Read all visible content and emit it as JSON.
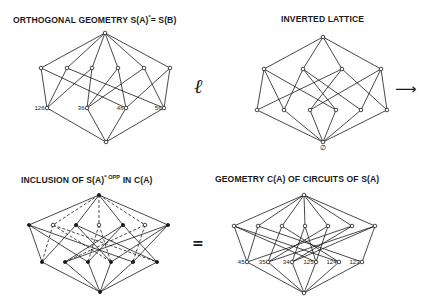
{
  "titles": {
    "top_left": "ORTHOGONAL GEOMETRY S(A)",
    "top_left_sup": "*",
    "top_left_tail": "= S(B)",
    "top_right": "INVERTED LATTICE",
    "bottom_left": "INCLUSION OF S(A)",
    "bottom_left_sup": "* OPP",
    "bottom_left_tail": " IN C(A)",
    "bottom_right": "GEOMETRY C(A) OF CIRCUITS OF S(A)"
  },
  "symbols": {
    "ell": "ℓ",
    "arrow": "⟶",
    "equals": "=",
    "empty_set": "∅"
  },
  "colors": {
    "ink": "#1a1a1a",
    "paper": "#ffffff"
  },
  "lattices": [
    {
      "id": "orthogonal-geometry",
      "nodes": [
        {
          "id": "T",
          "x": 105,
          "y": 33,
          "style": "hollow"
        },
        {
          "id": "M0",
          "x": 41,
          "y": 68,
          "style": "hollow"
        },
        {
          "id": "M1",
          "x": 67,
          "y": 68,
          "style": "hollow"
        },
        {
          "id": "M2",
          "x": 92,
          "y": 68,
          "style": "hollow"
        },
        {
          "id": "M3",
          "x": 118,
          "y": 68,
          "style": "hollow"
        },
        {
          "id": "M4",
          "x": 144,
          "y": 68,
          "style": "hollow"
        },
        {
          "id": "M5",
          "x": 170,
          "y": 68,
          "style": "hollow"
        },
        {
          "id": "B0",
          "x": 47,
          "y": 108,
          "style": "hollow",
          "label": "126"
        },
        {
          "id": "B1",
          "x": 87,
          "y": 108,
          "style": "hollow",
          "label": "36"
        },
        {
          "id": "B2",
          "x": 126,
          "y": 108,
          "style": "hollow",
          "label": "46"
        },
        {
          "id": "B3",
          "x": 164,
          "y": 108,
          "style": "hollow",
          "label": "56"
        },
        {
          "id": "Z",
          "x": 106,
          "y": 142,
          "style": "hollow"
        }
      ],
      "edges": [
        [
          "T",
          "M0"
        ],
        [
          "T",
          "M1"
        ],
        [
          "T",
          "M2"
        ],
        [
          "T",
          "M3"
        ],
        [
          "T",
          "M4"
        ],
        [
          "T",
          "M5"
        ],
        [
          "M0",
          "B0"
        ],
        [
          "M0",
          "B2"
        ],
        [
          "M1",
          "B0"
        ],
        [
          "M1",
          "B3"
        ],
        [
          "M2",
          "B0"
        ],
        [
          "M2",
          "B1"
        ],
        [
          "M3",
          "B1"
        ],
        [
          "M3",
          "B2"
        ],
        [
          "M4",
          "B1"
        ],
        [
          "M4",
          "B3"
        ],
        [
          "M5",
          "B2"
        ],
        [
          "M5",
          "B3"
        ],
        [
          "B0",
          "Z"
        ],
        [
          "B1",
          "Z"
        ],
        [
          "B2",
          "Z"
        ],
        [
          "B3",
          "Z"
        ]
      ],
      "dashed_edges": []
    },
    {
      "id": "inverted-lattice",
      "nodes": [
        {
          "id": "T",
          "x": 323,
          "y": 37,
          "style": "hollow"
        },
        {
          "id": "M0",
          "x": 264,
          "y": 69,
          "style": "hollow"
        },
        {
          "id": "M1",
          "x": 303,
          "y": 69,
          "style": "hollow"
        },
        {
          "id": "M2",
          "x": 342,
          "y": 69,
          "style": "hollow"
        },
        {
          "id": "M3",
          "x": 381,
          "y": 69,
          "style": "hollow"
        },
        {
          "id": "B0",
          "x": 257,
          "y": 110,
          "style": "hollow"
        },
        {
          "id": "B1",
          "x": 284,
          "y": 110,
          "style": "hollow"
        },
        {
          "id": "B2",
          "x": 310,
          "y": 110,
          "style": "hollow"
        },
        {
          "id": "B3",
          "x": 336,
          "y": 110,
          "style": "hollow"
        },
        {
          "id": "B4",
          "x": 361,
          "y": 110,
          "style": "hollow"
        },
        {
          "id": "B5",
          "x": 387,
          "y": 110,
          "style": "hollow"
        },
        {
          "id": "Z",
          "x": 323,
          "y": 142,
          "style": "hollow"
        }
      ],
      "edges": [
        [
          "T",
          "M0"
        ],
        [
          "T",
          "M1"
        ],
        [
          "T",
          "M2"
        ],
        [
          "T",
          "M3"
        ],
        [
          "M0",
          "B0"
        ],
        [
          "M0",
          "B1"
        ],
        [
          "M0",
          "B3"
        ],
        [
          "M1",
          "B1"
        ],
        [
          "M1",
          "B3"
        ],
        [
          "M1",
          "B4"
        ],
        [
          "M2",
          "B0"
        ],
        [
          "M2",
          "B2"
        ],
        [
          "M2",
          "B5"
        ],
        [
          "M3",
          "B2"
        ],
        [
          "M3",
          "B4"
        ],
        [
          "M3",
          "B5"
        ],
        [
          "B0",
          "Z"
        ],
        [
          "B1",
          "Z"
        ],
        [
          "B2",
          "Z"
        ],
        [
          "B3",
          "Z"
        ],
        [
          "B4",
          "Z"
        ],
        [
          "B5",
          "Z"
        ]
      ],
      "dashed_edges": []
    },
    {
      "id": "inclusion-lattice",
      "nodes": [
        {
          "id": "T",
          "x": 99,
          "y": 195,
          "style": "solid"
        },
        {
          "id": "S0",
          "x": 29,
          "y": 225,
          "style": "solid"
        },
        {
          "id": "H0",
          "x": 53,
          "y": 225,
          "style": "hollow"
        },
        {
          "id": "S1",
          "x": 76,
          "y": 225,
          "style": "solid"
        },
        {
          "id": "H1",
          "x": 99,
          "y": 225,
          "style": "hollow"
        },
        {
          "id": "S2",
          "x": 123,
          "y": 225,
          "style": "solid"
        },
        {
          "id": "H2",
          "x": 145,
          "y": 225,
          "style": "hollow"
        },
        {
          "id": "S3",
          "x": 168,
          "y": 225,
          "style": "solid"
        },
        {
          "id": "B0",
          "x": 42,
          "y": 262,
          "style": "solid"
        },
        {
          "id": "B1",
          "x": 65,
          "y": 262,
          "style": "solid"
        },
        {
          "id": "B2",
          "x": 88,
          "y": 262,
          "style": "solid"
        },
        {
          "id": "B3",
          "x": 111,
          "y": 262,
          "style": "solid"
        },
        {
          "id": "B4",
          "x": 133,
          "y": 262,
          "style": "solid"
        },
        {
          "id": "B5",
          "x": 157,
          "y": 262,
          "style": "solid"
        },
        {
          "id": "Z",
          "x": 100,
          "y": 292,
          "style": "solid"
        }
      ],
      "edges": [
        [
          "T",
          "S0"
        ],
        [
          "T",
          "S1"
        ],
        [
          "T",
          "S2"
        ],
        [
          "T",
          "S3"
        ],
        [
          "S0",
          "B0"
        ],
        [
          "S0",
          "B2"
        ],
        [
          "S0",
          "B4"
        ],
        [
          "S1",
          "B0"
        ],
        [
          "S1",
          "B3"
        ],
        [
          "S1",
          "B5"
        ],
        [
          "S2",
          "B1"
        ],
        [
          "S2",
          "B2"
        ],
        [
          "S2",
          "B5"
        ],
        [
          "S3",
          "B1"
        ],
        [
          "S3",
          "B3"
        ],
        [
          "S3",
          "B4"
        ],
        [
          "B0",
          "Z"
        ],
        [
          "B1",
          "Z"
        ],
        [
          "B2",
          "Z"
        ],
        [
          "B3",
          "Z"
        ],
        [
          "B4",
          "Z"
        ],
        [
          "B5",
          "Z"
        ]
      ],
      "dashed_edges": [
        [
          "T",
          "H0"
        ],
        [
          "T",
          "H1"
        ],
        [
          "T",
          "H2"
        ],
        [
          "H0",
          "B0"
        ],
        [
          "H0",
          "B5"
        ],
        [
          "H0",
          "B3"
        ],
        [
          "H1",
          "B2"
        ],
        [
          "H1",
          "B3"
        ],
        [
          "H2",
          "B1"
        ],
        [
          "H2",
          "B4"
        ]
      ]
    },
    {
      "id": "circuits-geometry",
      "nodes": [
        {
          "id": "T",
          "x": 304,
          "y": 195,
          "style": "hollow"
        },
        {
          "id": "M0",
          "x": 234,
          "y": 226,
          "style": "hollow"
        },
        {
          "id": "M1",
          "x": 258,
          "y": 226,
          "style": "hollow"
        },
        {
          "id": "M2",
          "x": 282,
          "y": 226,
          "style": "hollow"
        },
        {
          "id": "M3",
          "x": 305,
          "y": 226,
          "style": "hollow"
        },
        {
          "id": "M4",
          "x": 328,
          "y": 226,
          "style": "hollow"
        },
        {
          "id": "M5",
          "x": 352,
          "y": 226,
          "style": "hollow"
        },
        {
          "id": "M6",
          "x": 375,
          "y": 226,
          "style": "hollow"
        },
        {
          "id": "B0",
          "x": 247,
          "y": 262,
          "style": "hollow",
          "label": "45"
        },
        {
          "id": "B1",
          "x": 268,
          "y": 262,
          "style": "hollow",
          "label": "35"
        },
        {
          "id": "B2",
          "x": 292,
          "y": 262,
          "style": "hollow",
          "label": "34"
        },
        {
          "id": "B3",
          "x": 316,
          "y": 262,
          "style": "hollow",
          "label": "125"
        },
        {
          "id": "B4",
          "x": 339,
          "y": 262,
          "style": "hollow",
          "label": "124"
        },
        {
          "id": "B5",
          "x": 362,
          "y": 262,
          "style": "hollow",
          "label": "123"
        },
        {
          "id": "Z",
          "x": 304,
          "y": 293,
          "style": "hollow"
        }
      ],
      "edges": [
        [
          "T",
          "M0"
        ],
        [
          "T",
          "M1"
        ],
        [
          "T",
          "M2"
        ],
        [
          "T",
          "M3"
        ],
        [
          "T",
          "M4"
        ],
        [
          "T",
          "M5"
        ],
        [
          "T",
          "M6"
        ],
        [
          "M0",
          "B0"
        ],
        [
          "M0",
          "B3"
        ],
        [
          "M0",
          "B4"
        ],
        [
          "M1",
          "B0"
        ],
        [
          "M1",
          "B5"
        ],
        [
          "M2",
          "B1"
        ],
        [
          "M2",
          "B4"
        ],
        [
          "M3",
          "B2"
        ],
        [
          "M3",
          "B3"
        ],
        [
          "M4",
          "B1"
        ],
        [
          "M4",
          "B3"
        ],
        [
          "M5",
          "B0"
        ],
        [
          "M5",
          "B2"
        ],
        [
          "M6",
          "B1"
        ],
        [
          "M6",
          "B2"
        ],
        [
          "M6",
          "B5"
        ],
        [
          "B0",
          "Z"
        ],
        [
          "B1",
          "Z"
        ],
        [
          "B2",
          "Z"
        ],
        [
          "B3",
          "Z"
        ],
        [
          "B4",
          "Z"
        ],
        [
          "B5",
          "Z"
        ]
      ],
      "dashed_edges": []
    }
  ]
}
